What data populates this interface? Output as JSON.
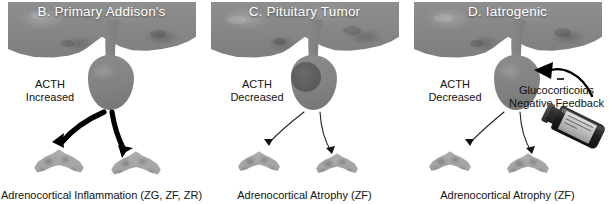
{
  "figure": {
    "type": "medical-diagram",
    "background_color": "#ffffff",
    "panels": [
      {
        "id": "b",
        "title": "B. Primary Addison's",
        "acth": {
          "line1": "ACTH",
          "line2": "Increased"
        },
        "caption": "Adrenocortical Inflammation (ZG, ZF, ZR)",
        "arrow_style": "bold",
        "arrow_count": 2,
        "has_tumor": false,
        "has_vial": false,
        "adrenal_state": "enlarged-inflamed",
        "adrenal_count": 2
      },
      {
        "id": "c",
        "title": "C. Pituitary Tumor",
        "acth": {
          "line1": "ACTH",
          "line2": "Decreased"
        },
        "caption": "Adrenocortical Atrophy (ZF)",
        "arrow_style": "thin",
        "arrow_count": 2,
        "has_tumor": true,
        "has_vial": false,
        "adrenal_state": "atrophic",
        "adrenal_count": 2
      },
      {
        "id": "d",
        "title": "D. Iatrogenic",
        "acth": {
          "line1": "ACTH",
          "line2": "Decreased"
        },
        "caption": "Adrenocortical Atrophy (ZF)",
        "arrow_style": "thin",
        "arrow_count": 2,
        "has_tumor": false,
        "has_vial": true,
        "adrenal_state": "atrophic",
        "adrenal_count": 2,
        "feedback": {
          "line1": "Glucocorticoids",
          "line2": "Negative Feedback",
          "sign": "−",
          "arrow_style": "bold-curved-inward"
        }
      }
    ],
    "colors": {
      "tissue_gray": "#888888",
      "pituitary_gray": "#828282",
      "tumor_gray": "#5c5c5c",
      "adrenal_gray": "#9a9a9a",
      "title_text": "#ffffff",
      "body_text": "#111111",
      "arrow_black": "#000000",
      "vial_dark": "#1e1e1e",
      "vial_label": "#c8c8c8"
    },
    "labels": {
      "anatomy_hypothalamus": "hypothalamus",
      "anatomy_pituitary": "pituitary gland",
      "anatomy_adrenal": "adrenal gland"
    }
  }
}
